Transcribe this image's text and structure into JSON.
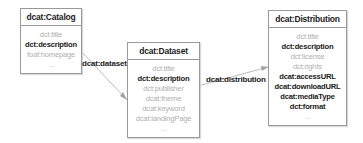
{
  "nodes": [
    {
      "id": "catalog",
      "title": "dcat:Catalog",
      "attributes": [
        {
          "text": "dct:title",
          "style": "light"
        },
        {
          "text": "dct:description",
          "style": "bold"
        },
        {
          "text": "foaf:homepage",
          "style": "light"
        },
        {
          "text": "...",
          "style": "dots"
        }
      ]
    },
    {
      "id": "dataset",
      "title": "dcat:Dataset",
      "attributes": [
        {
          "text": "dct:title",
          "style": "light"
        },
        {
          "text": "dct:description",
          "style": "bold"
        },
        {
          "text": "dct:publisher",
          "style": "light"
        },
        {
          "text": "dcat:theme",
          "style": "light"
        },
        {
          "text": "dcat:keyword",
          "style": "light"
        },
        {
          "text": "dcat:landingPage",
          "style": "light"
        },
        {
          "text": "...",
          "style": "dots"
        }
      ]
    },
    {
      "id": "distribution",
      "title": "dcat:Distribution",
      "attributes": [
        {
          "text": "dct:title",
          "style": "light"
        },
        {
          "text": "dct:description",
          "style": "bold"
        },
        {
          "text": "dct:license",
          "style": "light"
        },
        {
          "text": "dct:rights",
          "style": "light"
        },
        {
          "text": "dcat:accessURL",
          "style": "bold"
        },
        {
          "text": "dcat:downloadURL",
          "style": "bold"
        },
        {
          "text": "dcat:mediaType",
          "style": "bold"
        },
        {
          "text": "dct:format",
          "style": "bold"
        },
        {
          "text": "...",
          "style": "dots"
        }
      ]
    }
  ],
  "edges": [
    {
      "from": "catalog",
      "to": "dataset",
      "label": "dcat:dataset"
    },
    {
      "from": "dataset",
      "to": "distribution",
      "label": "dcat:distribution"
    }
  ],
  "colors": {
    "border": "#9a9a9a",
    "edge": "#a0a0a0",
    "light_text": "#b0b0b0",
    "bold_text": "#1a1a1a"
  }
}
